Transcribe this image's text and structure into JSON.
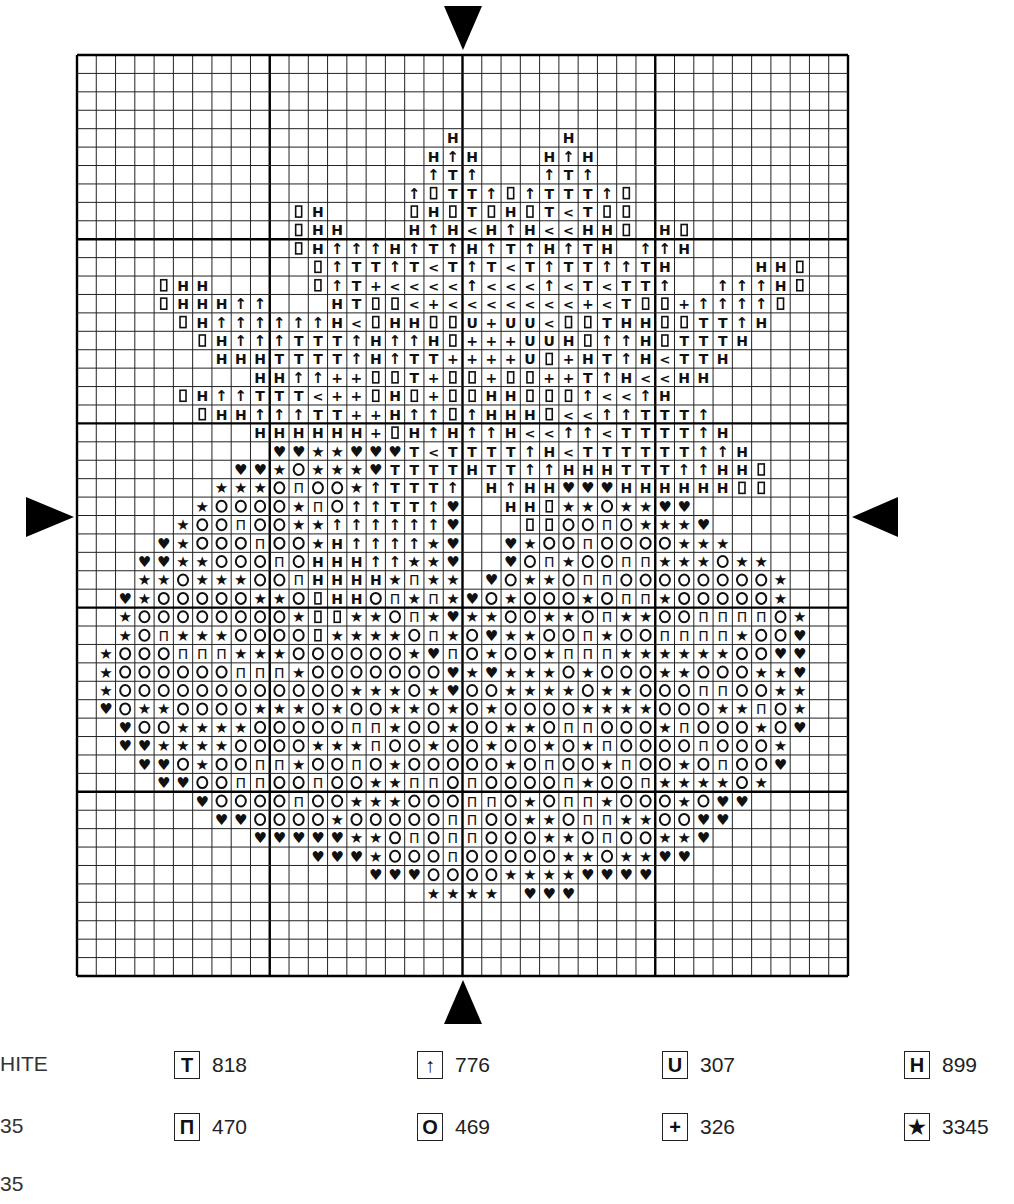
{
  "chart": {
    "columns": 40,
    "rows": 50,
    "grid": {
      "left": 77,
      "top": 55,
      "right": 848,
      "bottom": 976,
      "major_every": 10,
      "line_color": "#222222",
      "major_line_color": "#000000"
    },
    "center_markers": [
      "top-arrow",
      "bottom-arrow",
      "left-arrow",
      "right-arrow"
    ],
    "symbol_key": {
      "H": "H",
      "A": "↑",
      "T": "T",
      "L": "<",
      "D": "▯",
      "+": "+",
      "U": "U",
      "S": "★",
      "O": "O",
      "P": "Π",
      "V": "♥"
    },
    "cells": [
      "........................................",
      "........................................",
      "........................................",
      "........................................",
      "...................H.....H..............",
      "..................HAH...HAH.............",
      "..................ATA...ATA.............",
      ".................ADTTADATTTAD...........",
      "...........DH....DHDTDHDTLTDD...........",
      "...........DHH...HAHLHAHLLHHD.HD........",
      "...........DHAAAHATAHATAHATH.AAH........",
      "............DATTATLTATLTATTAATH....HHD..",
      "....DHH.....DAT+LLLLALLLALTLTTA..AAAHD..",
      "....DHHHAA...HTDDL+LLLLLLL+LTDD+AAAAD...",
      ".....DHAAAAAAHLDHHDDU+UULDDTHHDDTTAH....",
      "......DHAAATTTAHAAHD+++UUHDAAHDTTTH.....",
      ".......HHHTTTTAHATT++++UD+HTAHLTTH......",
      ".........HHAA++DDT+DD+DD++TAHLLHH.......",
      ".....DHAATTTL++DHD+DDHHDDDALLAH.........",
      "......DHHAAATT++HAADAHHHDLLAATTTA.......",
      ".........HHHHHH+DHAHAAHLLAALTTTTAH......",
      "..........VVSSVVVTLTTTTAHLTTTTTTAAH.....",
      "........VVSOSSSVTTTTHTTAAHHHTTTAAHHD....",
      ".......SSSOPOOSATTTA.HAHHVVVHHHHHHDD....",
      "......SOOOOSPOAATTAV..HHDSSOSSVV........",
      ".....SOOPOOSSAAAAAAV...DDOOPOSSSV.......",
      "....VSOOOPOOSHAAAASV..VSOOPOOOOSSS......",
      "...VVSSOOOPOHHHAASSV..VOPSOOPPSSSOSS....",
      "...SSOSSSOOPHHHHSPSS.VOSSOPPOOOOOOOOS...",
      "..VSOOOOOSSODHHOPSPSVOSOOOSOPPSOOOOOS...",
      "..SOOOOOOOOSDDSSOPSVSSOOSSOPSSOOPPPPOS..",
      "..SOPSSSOOOODSSSSOPSOVSSOOPSOOPPPPSOOV..",
      ".SOOOPPPSSSOOOOOOSVPOSOOSPPPSSSSSSOOVV..",
      ".SOOOOOOPPPSOOOOOOOVSVSSSOSOOOSSOOOSSV..",
      ".SOOOOOOOOOOOOSSSOSVOOSSSSOSSOOOPPOOSS..",
      ".VOSSOOOOSSSOSOOSSOSOSOOOOSSSSOOOSSPOS..",
      "..VOOSSSSOOOOOPPSOOSOOSSOPPOOOSPOOOSOV..",
      "..VVSSSSOOOOSSSPOOSOOSOOSOSPOOOOPOOOS...",
      "...VVOSOOPPSOOPOSOOOOOSOPOOSPOOSOPOOV...",
      "....VVOOPPOOPOOSSPPOPOOOOPSOOPSSSSOS....",
      "......VOOOOPOOSSSOOOPPOSOPPSOOOSOVV.....",
      ".......VVOOOOSOOOOOPPOOSSOPPSSOOVV......",
      ".........VVVVVSSOPOPPOOOSSOPOOSSV.......",
      "............VVVSOOOPOOOOOSSOSSVV........",
      "...............VVVOOOOSSSSVVVV..........",
      "..................SSSS.VVV..............",
      "........................................",
      "........................................",
      "........................................",
      "........................................"
    ]
  },
  "legend": {
    "clipped_labels": [
      "HITE",
      "35",
      "35"
    ],
    "rows": [
      [
        {
          "symbol": "T",
          "icon": "t-symbol-icon",
          "code": "818"
        },
        {
          "symbol": "↑",
          "icon": "arrow-up-symbol-icon",
          "code": "776"
        },
        {
          "symbol": "U",
          "icon": "u-symbol-icon",
          "code": "307"
        },
        {
          "symbol": "H",
          "icon": "h-symbol-icon",
          "code": "899"
        }
      ],
      [
        {
          "symbol": "Π",
          "icon": "pi-symbol-icon",
          "code": "470"
        },
        {
          "symbol": "O",
          "icon": "o-symbol-icon",
          "code": "469"
        },
        {
          "symbol": "+",
          "icon": "plus-symbol-icon",
          "code": "326"
        },
        {
          "symbol": "★",
          "icon": "star-symbol-icon",
          "code": "3345"
        }
      ]
    ]
  }
}
